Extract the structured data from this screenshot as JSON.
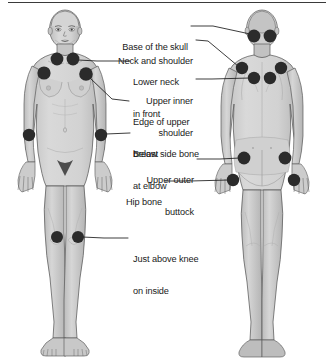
{
  "diagram": {
    "figures": [
      {
        "name": "front-body-figure",
        "view": "front"
      },
      {
        "name": "back-body-figure",
        "view": "back"
      }
    ],
    "colors": {
      "tender_point": "#2b2b2b",
      "body_fill": "#c9c9c9",
      "body_shade": "#b0b0b0",
      "body_highlight": "#d8d8d8",
      "outline": "#4a4a4a",
      "leader_line": "#1a1a1a",
      "text": "#1a1a1a",
      "rule": "#3a3a3a",
      "background": "#ffffff"
    },
    "labels": [
      {
        "id": "base-of-skull",
        "line1": "Base of the skull",
        "line2": ""
      },
      {
        "id": "neck-and-shoulder",
        "line1": "Neck and shoulder",
        "line2": ""
      },
      {
        "id": "lower-neck-in-front",
        "line1": "Lower neck",
        "line2": "in front"
      },
      {
        "id": "upper-inner-shoulder",
        "line1": "Upper inner",
        "line2": "shoulder"
      },
      {
        "id": "edge-of-upper-breast",
        "line1": "Edge of upper",
        "line2": "breast"
      },
      {
        "id": "below-side-bone-at-elbow",
        "line1": "Below side bone",
        "line2": "at elbow"
      },
      {
        "id": "upper-outer-buttock",
        "line1": "Upper outer",
        "line2": "buttock"
      },
      {
        "id": "hip-bone",
        "line1": "Hip bone",
        "line2": ""
      },
      {
        "id": "just-above-knee-on-inside",
        "line1": "Just above knee",
        "line2": "on inside"
      }
    ],
    "tender_points": {
      "front": [
        {
          "id": "lower-neck-left",
          "cx": 57,
          "cy": 59
        },
        {
          "id": "lower-neck-right",
          "cx": 73,
          "cy": 59
        },
        {
          "id": "edge-upper-breast-left",
          "cx": 44,
          "cy": 73
        },
        {
          "id": "edge-upper-breast-right",
          "cx": 86,
          "cy": 74
        },
        {
          "id": "elbow-left",
          "cx": 29,
          "cy": 135
        },
        {
          "id": "elbow-right",
          "cx": 101,
          "cy": 135
        },
        {
          "id": "knee-left",
          "cx": 57,
          "cy": 237
        },
        {
          "id": "knee-right",
          "cx": 78,
          "cy": 237
        }
      ],
      "back": [
        {
          "id": "skull-base-left",
          "cx": 254,
          "cy": 36
        },
        {
          "id": "skull-base-right",
          "cx": 270,
          "cy": 36
        },
        {
          "id": "neck-shoulder-left",
          "cx": 242,
          "cy": 68
        },
        {
          "id": "neck-shoulder-right",
          "cx": 281,
          "cy": 68
        },
        {
          "id": "upper-inner-shoulder-left",
          "cx": 254,
          "cy": 78
        },
        {
          "id": "upper-inner-shoulder-right",
          "cx": 270,
          "cy": 78
        },
        {
          "id": "buttock-left",
          "cx": 244,
          "cy": 158
        },
        {
          "id": "buttock-right",
          "cx": 285,
          "cy": 158
        },
        {
          "id": "hip-bone-left",
          "cx": 233,
          "cy": 180
        },
        {
          "id": "hip-bone-right",
          "cx": 294,
          "cy": 180
        }
      ]
    }
  }
}
